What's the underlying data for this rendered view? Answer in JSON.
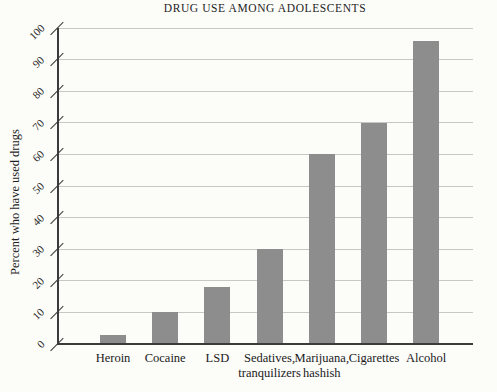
{
  "chart_data": {
    "type": "bar",
    "title": "DRUG USE AMONG ADOLESCENTS",
    "xlabel": "",
    "ylabel": "Percent who have used drugs",
    "categories": [
      "Heroin",
      "Cocaine",
      "LSD",
      "Sedatives, tranquilizers",
      "Marijuana, hashish",
      "Cigarettes",
      "Alcohol"
    ],
    "category_lines": [
      [
        "Heroin"
      ],
      [
        "Cocaine"
      ],
      [
        "LSD"
      ],
      [
        "Sedatives,",
        "tranquilizers"
      ],
      [
        "Marijuana,",
        "hashish"
      ],
      [
        "Cigarettes"
      ],
      [
        "Alcohol"
      ]
    ],
    "values": [
      3,
      10,
      18,
      30,
      60,
      70,
      96
    ],
    "ylim": [
      0,
      100
    ],
    "yticks": [
      0,
      10,
      20,
      30,
      40,
      50,
      60,
      70,
      80,
      90,
      100
    ],
    "grid": "horizontal",
    "legend": "none",
    "colors": {
      "bar": "#8d8d8d",
      "grid": "#c7c7c3",
      "axis": "#3b3b3b",
      "text": "#1e1e1e",
      "background": "#fcfcf9"
    }
  }
}
